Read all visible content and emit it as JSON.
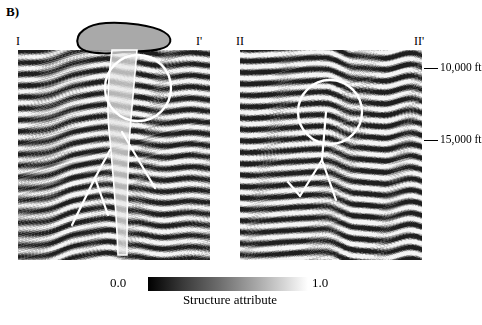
{
  "figure": {
    "panel_label": "B)",
    "left_section": {
      "start_label": "I",
      "end_label": "I'"
    },
    "right_section": {
      "start_label": "II",
      "end_label": "II'"
    },
    "depth_axis": {
      "ticks": [
        {
          "label": "10,000 ft",
          "value": 10000
        },
        {
          "label": "15,000 ft",
          "value": 15000
        }
      ]
    },
    "colorbar": {
      "min_label": "0.0",
      "max_label": "1.0",
      "title": "Structure attribute",
      "min_color": "#000000",
      "max_color": "#ffffff"
    },
    "annotations": {
      "salt_body_outline_color": "#000000",
      "salt_body_fill_color": "#9a9a9a",
      "highlight_circle_color": "#ffffff",
      "fault_line_color": "#ffffff"
    }
  }
}
